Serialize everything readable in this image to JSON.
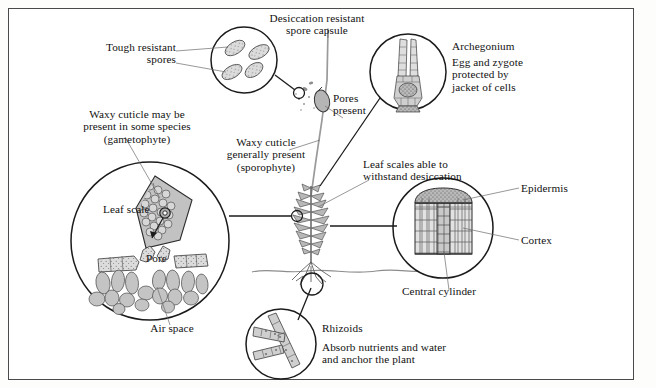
{
  "figure": {
    "background_color": "#ffffff",
    "frame_color": "#4a4a4a",
    "ink_color": "#111111",
    "fill_light": "#d8d8d8",
    "fill_mid": "#bfbfbf",
    "fill_dark": "#8f8f8f"
  },
  "labels": {
    "tough_resistant_spores": "Tough resistant\nspores",
    "desiccation_resistant_spore_capsule": "Desiccation resistant\nspore capsule",
    "archegonium_title": "Archegonium",
    "archegonium_body": "Egg and zygote\nprotected by\njacket of cells",
    "pores_present": "Pores\npresent",
    "waxy_cuticle_gametophyte": "Waxy cuticle may be\npresent in some species\n(gametophyte)",
    "waxy_cuticle_sporophyte": "Waxy cuticle\ngenerally present\n(sporophyte)",
    "leaf_scales_desiccation": "Leaf scales able to\nwithstand desiccation",
    "leaf_scale": "Leaf scale",
    "pore": "Pore",
    "air_space": "Air space",
    "epidermis": "Epidermis",
    "cortex": "Cortex",
    "central_cylinder": "Central cylinder",
    "rhizoids_title": "Rhizoids",
    "rhizoids_body": "Absorb nutrients and water\nand anchor the plant"
  },
  "insets": [
    {
      "name": "spores-inset",
      "depicts": "four stippled oval spores",
      "cx": 244,
      "cy": 60,
      "r": 33,
      "label_key": "tough_resistant_spores"
    },
    {
      "name": "archegonium-inset",
      "depicts": "flask shaped archegonium with neck, venter, egg cells",
      "cx": 408,
      "cy": 72,
      "r": 38,
      "label_key": "archegonium_title"
    },
    {
      "name": "leaf-scale-pore-inset",
      "depicts": "leaf scale surface with pore and air space chambers",
      "cx": 150,
      "cy": 241,
      "r": 79,
      "label_key": "leaf_scale"
    },
    {
      "name": "stem-section-inset",
      "depicts": "stem cross-section cylinder showing epidermis, cortex, central cylinder",
      "cx": 443,
      "cy": 228,
      "r": 50,
      "label_key": "epidermis"
    },
    {
      "name": "rhizoids-inset",
      "depicts": "branched multicellular rhizoid filaments",
      "cx": 281,
      "cy": 344,
      "r": 35,
      "label_key": "rhizoids_title"
    }
  ],
  "plant": {
    "name": "central-moss-plant",
    "parts": [
      "spore capsule",
      "seta stalk",
      "leafy gametophyte shoot",
      "rhizoids",
      "soil line"
    ],
    "soil_line_y": 271
  }
}
